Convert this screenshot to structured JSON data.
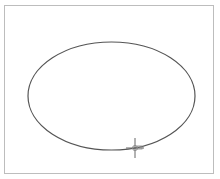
{
  "canvas": {
    "background": "#ffffff",
    "border_color": "#bdbdbd"
  },
  "shapes": [
    {
      "type": "ellipse",
      "cx": 111.5,
      "cy": 96,
      "rx": 83.5,
      "ry": 54,
      "stroke": "#555555",
      "fill": "none"
    }
  ],
  "cursor": {
    "icon": "crosshair-move-icon",
    "x": 135,
    "y": 148,
    "color": "#666666"
  }
}
